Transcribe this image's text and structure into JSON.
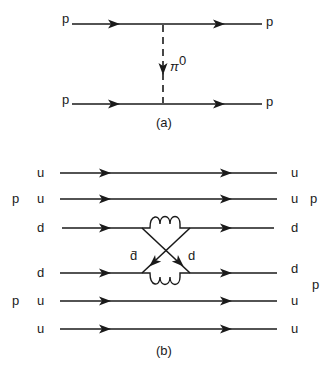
{
  "diagram_a": {
    "caption": "(a)",
    "incoming_top": "p",
    "outgoing_top": "p",
    "incoming_bottom": "p",
    "outgoing_bottom": "p",
    "exchange_label": "π",
    "exchange_superscript": "0"
  },
  "diagram_b": {
    "caption": "(b)",
    "proton_left_top": "p",
    "proton_left_bottom": "p",
    "proton_right_top": "p",
    "proton_right_bottom": "p",
    "quarks_left": [
      "u",
      "u",
      "d",
      "d",
      "u",
      "u"
    ],
    "quarks_right": [
      "u",
      "u",
      "d",
      "d",
      "u",
      "u"
    ],
    "exchange_antiquark": "d̄",
    "exchange_quark": "d"
  }
}
